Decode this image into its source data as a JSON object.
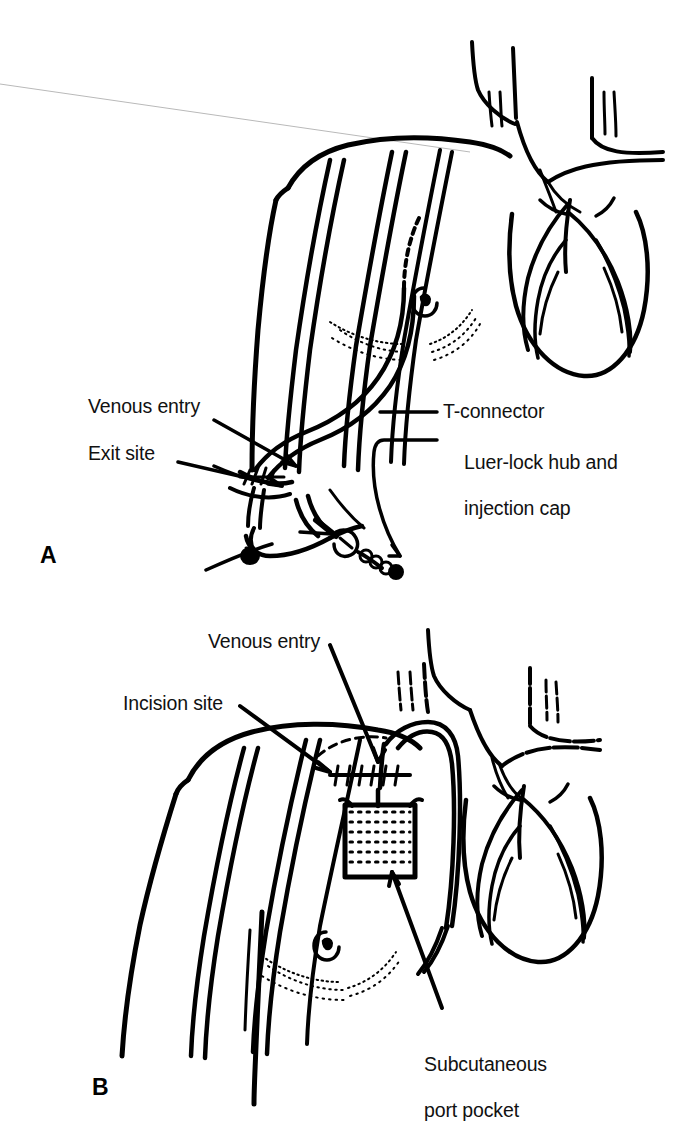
{
  "figure": {
    "background_color": "#ffffff",
    "ink_color": "#000000",
    "panels": [
      {
        "letter": "A",
        "name": "tunneled-catheter-panel",
        "description": "Tunneled central venous catheter with external exit site, T-connector and Luer-lock hub",
        "labels": [
          {
            "key": "venous_entry",
            "text": "Venous entry"
          },
          {
            "key": "exit_site",
            "text": "Exit site"
          },
          {
            "key": "t_connector",
            "text": "T-connector"
          },
          {
            "key": "luer_lock_line1",
            "text": "Luer-lock hub and"
          },
          {
            "key": "luer_lock_line2",
            "text": "injection cap"
          }
        ]
      },
      {
        "letter": "B",
        "name": "implanted-port-panel",
        "description": "Implanted subcutaneous venous access port with incision site",
        "labels": [
          {
            "key": "venous_entry",
            "text": "Venous entry"
          },
          {
            "key": "incision_site",
            "text": "Incision site"
          },
          {
            "key": "port_pocket_line1",
            "text": "Subcutaneous"
          },
          {
            "key": "port_pocket_line2",
            "text": "port pocket"
          }
        ]
      }
    ]
  },
  "panel_a": {
    "letter": "A",
    "venous_entry": "Venous entry",
    "exit_site": "Exit site",
    "t_connector": "T-connector",
    "luer_lock_line1": "Luer-lock hub and",
    "luer_lock_line2": "injection cap"
  },
  "panel_b": {
    "letter": "B",
    "venous_entry": "Venous entry",
    "incision_site": "Incision site",
    "port_pocket_line1": "Subcutaneous",
    "port_pocket_line2": "port pocket"
  }
}
